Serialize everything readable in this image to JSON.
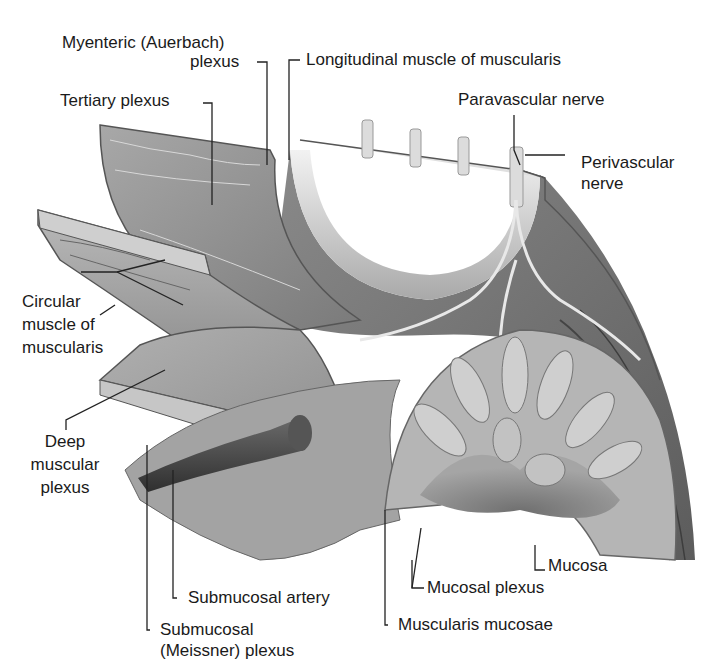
{
  "figure": {
    "title": "",
    "style": "grayscale anatomical illustration"
  },
  "labels": {
    "myenteric_line1": "Myenteric (Auerbach)",
    "myenteric_line2": "plexus",
    "longitudinal": "Longitudinal muscle of muscularis",
    "tertiary": "Tertiary plexus",
    "paravascular": "Paravascular nerve",
    "perivascular_line1": "Perivascular",
    "perivascular_line2": "nerve",
    "circular_line1": "Circular",
    "circular_line2": "muscle of",
    "circular_line3": "muscularis",
    "deep_line1": "Deep",
    "deep_line2": "muscular",
    "deep_line3": "plexus",
    "mucosa": "Mucosa",
    "submucosal_artery": "Submucosal artery",
    "mucosal_plexus": "Mucosal plexus",
    "submucosal_plexus_line1": "Submucosal",
    "submucosal_plexus_line2": "(Meissner) plexus",
    "muscularis_mucosae": "Muscularis mucosae"
  },
  "colors": {
    "background": "#ffffff",
    "text": "#1a1a1a",
    "leader_line": "#222222",
    "tissue_dark": "#6e6e6e",
    "tissue_mid": "#9a9a9a",
    "tissue_light": "#c8c8c8",
    "nerve": "#e2e2e2",
    "artery": "#4a4a4a"
  }
}
